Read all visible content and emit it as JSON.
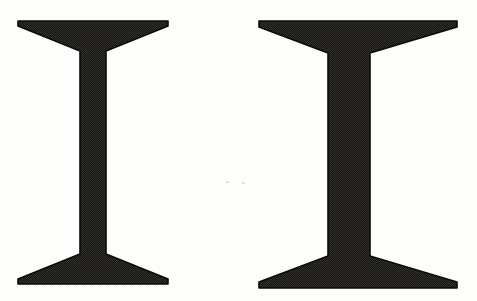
{
  "figure": {
    "alt": "two-steel-i-beam-cross-sections",
    "paper_color": "#fdfdfb",
    "ink_dark": "#131313",
    "ink_light": "#35322d",
    "outline_color": "#0a0a0a",
    "speck_color": "#c9c9c5",
    "canvas": {
      "width": 477,
      "height": 301
    },
    "beams": [
      {
        "name": "i-beam-left-thin-web",
        "flange_x1": 18,
        "flange_x2": 168,
        "web_x1": 80,
        "web_x2": 106,
        "top": 21,
        "bottom": 284,
        "tip_thickness": 5,
        "flange_root_depth": 30
      },
      {
        "name": "i-beam-right-thick-web",
        "flange_x1": 259,
        "flange_x2": 457,
        "web_x1": 328,
        "web_x2": 370,
        "top": 21,
        "bottom": 288,
        "tip_thickness": 6,
        "flange_root_depth": 32
      }
    ],
    "noise_specks": [
      {
        "x": 226,
        "y": 181
      },
      {
        "x": 242,
        "y": 182
      }
    ]
  }
}
